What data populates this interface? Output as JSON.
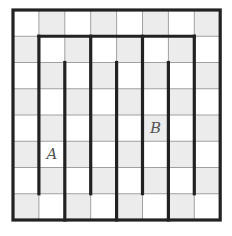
{
  "diagram": {
    "grid": {
      "rows": 8,
      "cols": 8,
      "origin_x": 13,
      "origin_y": 10,
      "cell_width": 25.9,
      "cell_height": 26.25,
      "pattern": "checkerboard",
      "shaded_when": "row+col odd"
    },
    "colors": {
      "background": "#ffffff",
      "shaded_cell": "#ececec",
      "thin_line": "#a0a0a0",
      "thick_line": "#222222",
      "label": "#555555"
    },
    "walls": [
      {
        "id": "outer-border",
        "type": "rect",
        "from": [
          0,
          0
        ],
        "to": [
          8,
          8
        ]
      },
      {
        "id": "inner-top",
        "type": "h",
        "row": 1,
        "col_from": 1,
        "col_to": 7
      },
      {
        "id": "wall-col-1",
        "type": "v",
        "col": 1,
        "row_from": 1,
        "row_to": 7
      },
      {
        "id": "wall-col-2",
        "type": "v",
        "col": 2,
        "row_from": 2,
        "row_to": 8
      },
      {
        "id": "wall-col-3",
        "type": "v",
        "col": 3,
        "row_from": 1,
        "row_to": 7
      },
      {
        "id": "wall-col-4",
        "type": "v",
        "col": 4,
        "row_from": 2,
        "row_to": 8
      },
      {
        "id": "wall-col-5",
        "type": "v",
        "col": 5,
        "row_from": 1,
        "row_to": 7
      },
      {
        "id": "wall-col-6",
        "type": "v",
        "col": 6,
        "row_from": 2,
        "row_to": 8
      },
      {
        "id": "wall-col-7",
        "type": "v",
        "col": 7,
        "row_from": 1,
        "row_to": 7
      }
    ],
    "labels": [
      {
        "text": "A",
        "row": 5,
        "col": 1
      },
      {
        "text": "B",
        "row": 4,
        "col": 5
      }
    ]
  }
}
